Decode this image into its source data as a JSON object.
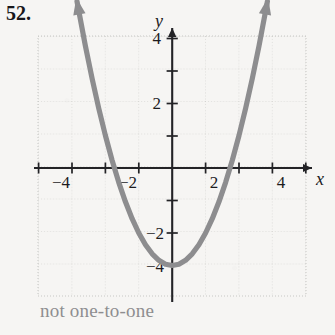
{
  "problem": {
    "number": "52.",
    "caption": "not one-to-one"
  },
  "colors": {
    "background": "#f6f5f3",
    "curve": "#8d8d8f",
    "axis": "#232326",
    "grid": "#c9c9c7",
    "label": "#1c1b1e",
    "caption": "#8e8e90"
  },
  "axes": {
    "x_label": "x",
    "y_label": "y",
    "x_ticks_labeled": [
      "-4",
      "-2",
      "2",
      "4"
    ],
    "y_ticks_labeled": [
      "4",
      "2",
      "-2",
      "-4"
    ]
  },
  "chart_data": {
    "type": "line",
    "title": "",
    "xlabel": "x",
    "ylabel": "y",
    "xlim": [
      -5,
      5
    ],
    "ylim": [
      -5,
      5
    ],
    "grid": true,
    "legend": null,
    "xticks": [
      -4,
      -3,
      -2,
      -1,
      0,
      1,
      2,
      3,
      4
    ],
    "yticks": [
      -4,
      -3,
      -2,
      -1,
      0,
      1,
      2,
      3,
      4
    ],
    "xticklabels": [
      "-4",
      "",
      "-2",
      "",
      "",
      "",
      "2",
      "",
      "4"
    ],
    "yticklabels": [
      "-4",
      "",
      "-2",
      "",
      "",
      "",
      "2",
      "",
      "4"
    ],
    "series": [
      {
        "name": "parabola",
        "equation": "y = x^2 - 3",
        "vertex": [
          0,
          -3
        ],
        "x_intercepts": [
          -1.73,
          1.73
        ],
        "y_intercept": -3,
        "arrow_ends": [
          "both"
        ],
        "x": [
          -2.85,
          -2.6,
          -2.4,
          -2.2,
          -2.0,
          -1.8,
          -1.6,
          -1.4,
          -1.2,
          -1.0,
          -0.8,
          -0.6,
          -0.4,
          -0.2,
          0,
          0.2,
          0.4,
          0.6,
          0.8,
          1.0,
          1.2,
          1.4,
          1.6,
          1.8,
          2.0,
          2.2,
          2.4,
          2.6,
          2.85
        ],
        "y": [
          5.12,
          3.76,
          2.76,
          1.84,
          1.0,
          0.24,
          -0.44,
          -1.04,
          -1.56,
          -2.0,
          -2.36,
          -2.64,
          -2.84,
          -2.96,
          -3.0,
          -2.96,
          -2.84,
          -2.64,
          -2.36,
          -2.0,
          -1.56,
          -1.04,
          -0.44,
          0.24,
          1.0,
          1.84,
          2.76,
          3.76,
          5.12
        ]
      }
    ],
    "annotation": "not one-to-one"
  }
}
